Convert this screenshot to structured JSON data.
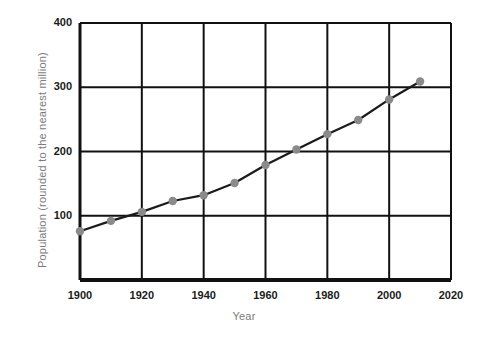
{
  "chart_data": {
    "type": "line",
    "title": "",
    "xlabel": "Year",
    "ylabel": "Population (rounded to the nearest million)",
    "xlim": [
      1900,
      2020
    ],
    "ylim": [
      0,
      400
    ],
    "grid": true,
    "legend": false,
    "marker": "circle",
    "marker_color": "#8a8a8a",
    "line_color": "#1b1b1b",
    "x": [
      1900,
      1910,
      1920,
      1930,
      1940,
      1950,
      1960,
      1970,
      1980,
      1990,
      2000,
      2010
    ],
    "values": [
      76,
      92,
      106,
      123,
      132,
      151,
      179,
      203,
      227,
      249,
      281,
      309
    ],
    "xticks": [
      "1900",
      "1920",
      "1940",
      "1960",
      "1980",
      "2000",
      "2020"
    ],
    "xtick_values": [
      1900,
      1920,
      1940,
      1960,
      1980,
      2000,
      2020
    ],
    "yticks": [
      "100",
      "200",
      "300",
      "400"
    ],
    "ytick_values": [
      100,
      200,
      300,
      400
    ]
  }
}
